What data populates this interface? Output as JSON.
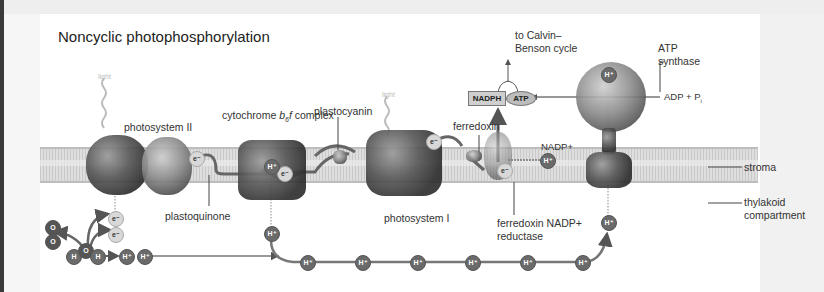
{
  "title": "Noncyclic photophosphorylation",
  "labels": {
    "light_1": "light",
    "light_2": "light",
    "photosystem_II": "photosystem II",
    "cytochrome": "cytochrome b6f complex",
    "cytochrome_prefix": "cytochrome ",
    "cytochrome_b": "b",
    "cytochrome_sub": "6",
    "cytochrome_f": "f",
    "cytochrome_suffix": " complex",
    "plastocyanin": "plastocyanin",
    "plastoquinone": "plastoquinone",
    "photosystem_I": "photosystem I",
    "ferredoxin": "ferredoxin",
    "ferredoxin_reductase_line1": "ferredoxin NADP+",
    "ferredoxin_reductase_line2": "reductase",
    "nadp_plus": "NADP+",
    "calvin_line1": "to Calvin–",
    "calvin_line2": "Benson cycle",
    "atp_synthase_line1": "ATP",
    "atp_synthase_line2": "synthase",
    "adp_pi": "ADP + P",
    "adp_pi_sub": "i",
    "stroma": "stroma",
    "thylakoid_line1": "thylakoid",
    "thylakoid_line2": "compartment"
  },
  "molecules": {
    "nadph": "NADPH",
    "atp": "ATP",
    "electron": "e⁻",
    "proton": "H⁺",
    "oxygen": "O",
    "hydrogen": "H"
  },
  "colors": {
    "membrane": "#d4d4d4",
    "protein_dark": "#333333",
    "bubble": "#6a6a6a",
    "electron_bubble": "#d8d8d8",
    "arrow": "#666666"
  }
}
